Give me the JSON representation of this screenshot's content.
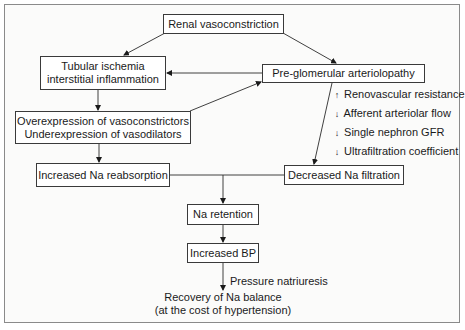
{
  "diagram": {
    "nodes": {
      "renal_vasoconstriction": "Renal vasoconstriction",
      "tubular_ischemia": [
        "Tubular ischemia",
        "interstitial inflammation"
      ],
      "preglomerular": "Pre-glomerular arteriolopathy",
      "overexpression": [
        "Overexpression of vasoconstrictors",
        "Underexpression of vasodilators"
      ],
      "increased_na_reabsorption": "Increased Na reabsorption",
      "decreased_na_filtration": "Decreased Na filtration",
      "na_retention": "Na retention",
      "increased_bp": "Increased BP",
      "recovery": [
        "Recovery of Na balance",
        "(at the cost of hypertension)"
      ]
    },
    "effects": [
      {
        "direction": "up",
        "label": "Renovascular resistance"
      },
      {
        "direction": "down",
        "label": "Afferent arteriolar flow"
      },
      {
        "direction": "down",
        "label": "Single nephron GFR"
      },
      {
        "direction": "down",
        "label": "Ultrafiltration coefficient"
      }
    ],
    "edge_labels": {
      "pressure_natriuresis": "Pressure natriuresis"
    },
    "edges": [
      [
        "renal_vasoconstriction",
        "tubular_ischemia"
      ],
      [
        "renal_vasoconstriction",
        "preglomerular"
      ],
      [
        "preglomerular",
        "tubular_ischemia"
      ],
      [
        "overexpression",
        "preglomerular"
      ],
      [
        "tubular_ischemia",
        "overexpression"
      ],
      [
        "overexpression",
        "increased_na_reabsorption"
      ],
      [
        "preglomerular",
        "decreased_na_filtration"
      ],
      [
        "increased_na_reabsorption",
        "na_retention"
      ],
      [
        "decreased_na_filtration",
        "na_retention"
      ],
      [
        "na_retention",
        "increased_bp"
      ],
      [
        "increased_bp",
        "recovery"
      ]
    ]
  }
}
